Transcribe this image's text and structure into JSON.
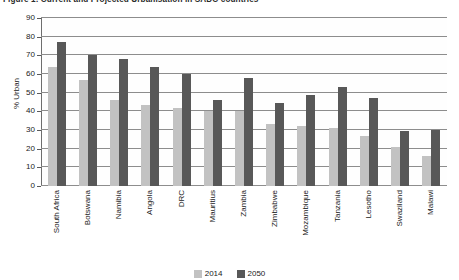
{
  "figure": {
    "title": "Figure 1: Current and Projected Urbanisation in SADC countries"
  },
  "legend": {
    "position": "bottom-center",
    "items": [
      {
        "label": "2014",
        "color": "#c2c2c2"
      },
      {
        "label": "2050",
        "color": "#585858"
      }
    ]
  },
  "axes": {
    "ylabel": "% Urban",
    "yticks": [
      "0",
      "10",
      "20",
      "30",
      "40",
      "50",
      "60",
      "70",
      "80",
      "90"
    ]
  },
  "chart_data": {
    "type": "bar",
    "title": "Figure 1: Current and Projected Urbanisation in SADC countries",
    "xlabel": "",
    "ylabel": "% Urban",
    "ylim": [
      0,
      90
    ],
    "ytick_step": 10,
    "grid": true,
    "legend_position": "bottom-center",
    "categories": [
      "South Africa",
      "Botswana",
      "Namibia",
      "Angola",
      "DRC",
      "Mauritius",
      "Zambia",
      "Zimbabwe",
      "Mozambique",
      "Tanzania",
      "Lesotho",
      "Swaziland",
      "Malawi"
    ],
    "series": [
      {
        "name": "2014",
        "color": "#c2c2c2",
        "values": [
          64,
          57,
          46,
          43.5,
          42,
          40,
          40,
          33,
          32,
          31,
          27,
          21,
          16
        ]
      },
      {
        "name": "2050",
        "color": "#585858",
        "values": [
          77,
          70,
          68,
          64,
          60,
          46,
          58,
          44.5,
          49,
          53,
          47,
          29.5,
          30
        ]
      }
    ]
  }
}
